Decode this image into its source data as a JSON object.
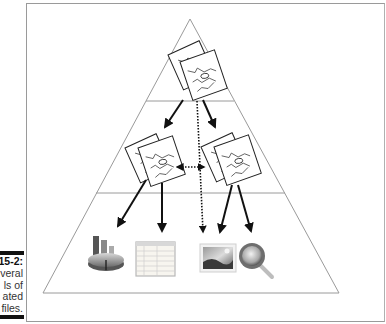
{
  "caption": {
    "figure_label": "15-2:",
    "lines": [
      "veral",
      "ls of",
      "ated",
      "files."
    ]
  },
  "diagram": {
    "type": "pyramid",
    "levels": [
      {
        "level": 1,
        "nodes": [
          {
            "name": "top-linked-file-icon",
            "kind": "linked-drawing-stack"
          }
        ]
      },
      {
        "level": 2,
        "nodes": [
          {
            "name": "left-linked-file-icon",
            "kind": "linked-drawing-stack"
          },
          {
            "name": "right-linked-file-icon",
            "kind": "linked-drawing-stack"
          }
        ]
      },
      {
        "level": 3,
        "nodes": [
          {
            "name": "chart-file-icon",
            "kind": "pie-bar-chart"
          },
          {
            "name": "spreadsheet-file-icon",
            "kind": "spreadsheet-table"
          },
          {
            "name": "image-file-icon",
            "kind": "landscape-photo"
          },
          {
            "name": "search-file-icon",
            "kind": "magnifying-glass"
          }
        ]
      }
    ],
    "links": [
      {
        "from": "top-linked-file-icon",
        "to": "left-linked-file-icon",
        "style": "solid-arrow"
      },
      {
        "from": "top-linked-file-icon",
        "to": "right-linked-file-icon",
        "style": "solid-arrow"
      },
      {
        "from": "top-linked-file-icon",
        "to": "image-file-icon",
        "style": "dotted-arrow"
      },
      {
        "from": "left-linked-file-icon",
        "to": "right-linked-file-icon",
        "style": "dotted-double-arrow"
      },
      {
        "from": "left-linked-file-icon",
        "to": "chart-file-icon",
        "style": "solid-arrow"
      },
      {
        "from": "left-linked-file-icon",
        "to": "spreadsheet-file-icon",
        "style": "solid-arrow"
      },
      {
        "from": "right-linked-file-icon",
        "to": "image-file-icon",
        "style": "solid-arrow"
      },
      {
        "from": "right-linked-file-icon",
        "to": "search-file-icon",
        "style": "solid-arrow"
      }
    ],
    "colors": {
      "pyramid_line": "#9a9a9a",
      "arrow": "#111111",
      "frame": "#9a9a9a"
    }
  }
}
